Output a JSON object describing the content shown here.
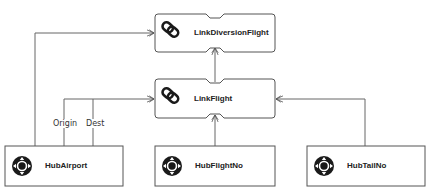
{
  "diagram": {
    "type": "data-vault-model",
    "colors": {
      "stroke": "#555555",
      "icon": "#1a1a1a",
      "text": "#222222",
      "background": "#ffffff"
    },
    "nodes": [
      {
        "id": "link_diversion_flight",
        "kind": "link",
        "label": "LinkDiversionFlight",
        "icon": "chain-link-icon"
      },
      {
        "id": "link_flight",
        "kind": "link",
        "label": "LinkFlight",
        "icon": "chain-link-icon"
      },
      {
        "id": "hub_airport",
        "kind": "hub",
        "label": "HubAirport",
        "icon": "hub-compass-icon"
      },
      {
        "id": "hub_flight_no",
        "kind": "hub",
        "label": "HubFlightNo",
        "icon": "hub-compass-icon"
      },
      {
        "id": "hub_tail_no",
        "kind": "hub",
        "label": "HubTailNo",
        "icon": "hub-compass-icon"
      }
    ],
    "edges": [
      {
        "from": "hub_airport",
        "to": "link_diversion_flight",
        "role": ""
      },
      {
        "from": "link_flight",
        "to": "link_diversion_flight",
        "role": ""
      },
      {
        "from": "hub_airport",
        "to": "link_flight",
        "role": "Origin"
      },
      {
        "from": "hub_airport",
        "to": "link_flight",
        "role": "Dest"
      },
      {
        "from": "hub_flight_no",
        "to": "link_flight",
        "role": ""
      },
      {
        "from": "hub_tail_no",
        "to": "link_flight",
        "role": ""
      }
    ],
    "roles": {
      "origin": "Origin",
      "dest": "Dest"
    }
  }
}
